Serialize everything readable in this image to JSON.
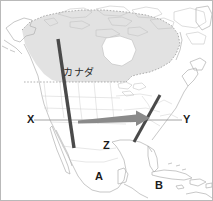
{
  "figure": {
    "width": 213,
    "height": 201,
    "background_color": "#ffffff",
    "frame_color": "#b9b9b9"
  },
  "colors": {
    "coastline": "#b0b0b0",
    "country_border": "#bdbdbd",
    "canada_fill": "#e2e2e2",
    "canada_border_dotted": "#8f8f8f",
    "mountain_range_line": "#4a4a4a",
    "arrow": "#8a8a8a",
    "section_line": "#9a9a9a",
    "label_text": "#1b1b1b"
  },
  "labels": {
    "canada_jp": "カナダ",
    "x": "X",
    "y": "Y",
    "z": "Z",
    "a": "A",
    "b": "B"
  },
  "annotations": {
    "section_line_name": "X-Y cross section line",
    "west_range_name": "western mountain range line",
    "east_range_name": "eastern mountain range line",
    "arrow_name": "eastward wind arrow"
  }
}
